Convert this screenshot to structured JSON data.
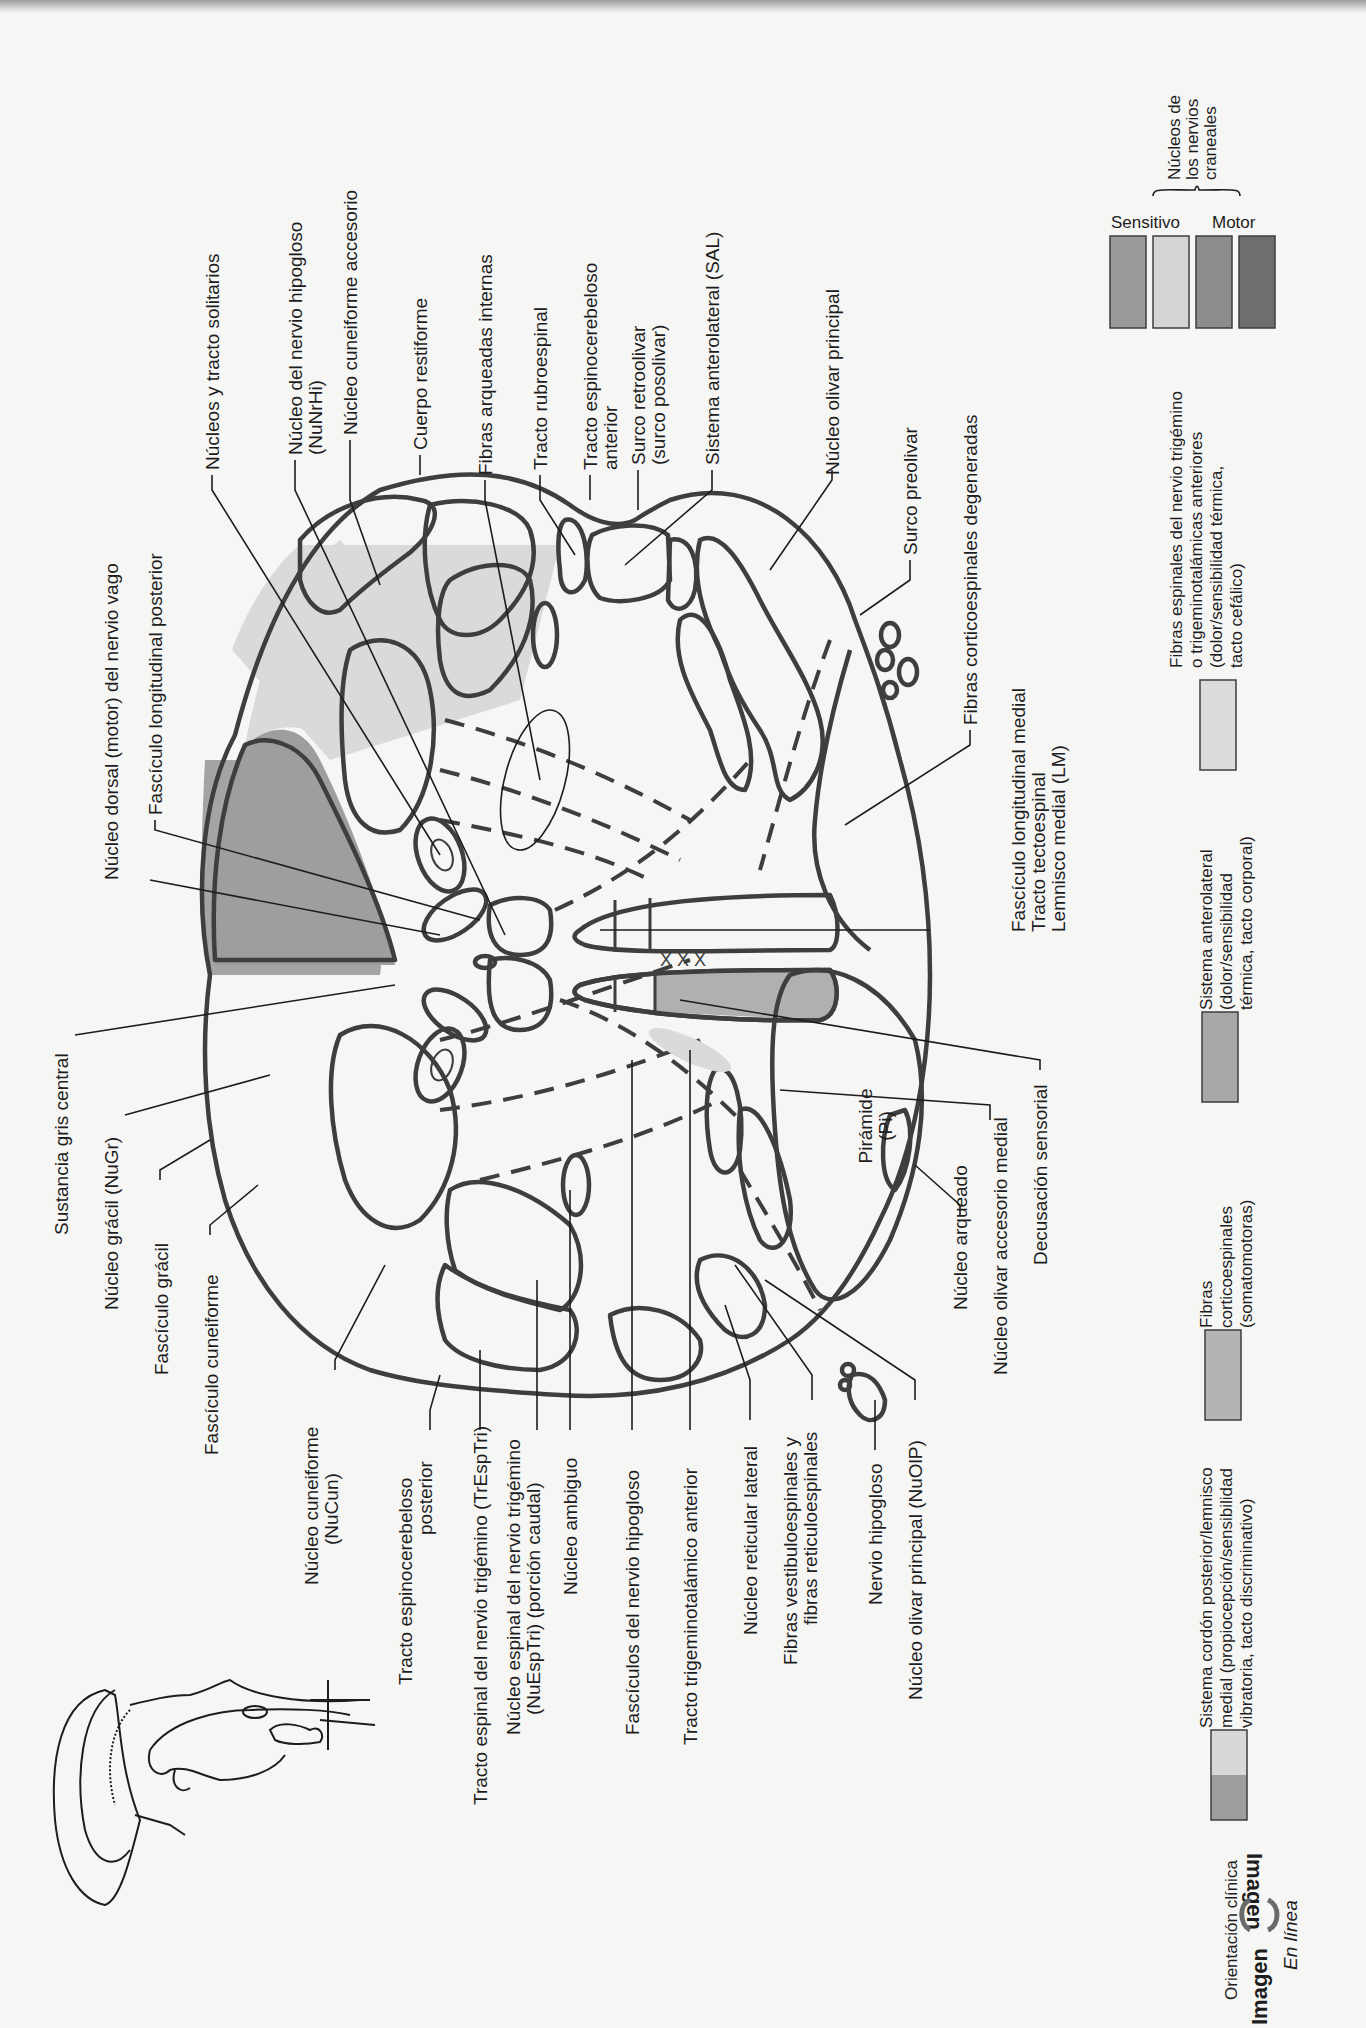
{
  "figure": {
    "orientation": "rotated-90-ccw",
    "cross_section_center_labels": {
      "piramide": "Pirámide",
      "piramide_abbr": "(Pi)"
    }
  },
  "labels_top": [
    {
      "id": "nucleos-tracto-solitarios",
      "lines": [
        "Núcleos y tracto solitarios"
      ]
    },
    {
      "id": "nucleo-nervio-hipogloso",
      "lines": [
        "Núcleo del nervio hipogloso",
        "(NuNrHi)"
      ]
    },
    {
      "id": "nucleo-cuneiforme-accesorio",
      "lines": [
        "Núcleo cuneiforme accesorio"
      ]
    },
    {
      "id": "cuerpo-restiforme",
      "lines": [
        "Cuerpo restiforme"
      ]
    },
    {
      "id": "fibras-arqueadas-internas",
      "lines": [
        "Fibras arqueadas internas"
      ]
    },
    {
      "id": "tracto-rubroespinal",
      "lines": [
        "Tracto rubroespinal"
      ]
    },
    {
      "id": "tracto-espinocerebeloso-anterior",
      "lines": [
        "Tracto espinocerebeloso",
        "anterior"
      ]
    },
    {
      "id": "surco-retroolivar",
      "lines": [
        "Surco retroolivar",
        "(surco posolivar)"
      ]
    },
    {
      "id": "sistema-anterolateral",
      "lines": [
        "Sistema anterolateral (SAL)"
      ]
    },
    {
      "id": "nucleo-olivar-principal-top",
      "lines": [
        "Núcleo olivar principal"
      ]
    },
    {
      "id": "surco-preolivar",
      "lines": [
        "Surco preolivar"
      ]
    },
    {
      "id": "fibras-corticoespinales-degeneradas",
      "lines": [
        "Fibras corticoespinales degeneradas"
      ]
    }
  ],
  "labels_left_upper": [
    {
      "id": "nucleo-dorsal-vago",
      "lines": [
        "Núcleo dorsal (motor) del nervio vago"
      ]
    },
    {
      "id": "fasciculo-longitudinal-posterior",
      "lines": [
        "Fascículo longitudinal posterior"
      ]
    }
  ],
  "labels_right_mid": [
    {
      "id": "flm-tt-lm",
      "lines": [
        "Fascículo longitudinal medial",
        "Tracto tectoespinal",
        "Lemnisco medial (LM)"
      ]
    },
    {
      "id": "decusacion-sensorial",
      "lines": [
        "Decusación sensorial"
      ]
    },
    {
      "id": "nucleo-olivar-accesorio-medial",
      "lines": [
        "Núcleo olivar accesorio medial"
      ]
    },
    {
      "id": "nucleo-arqueado",
      "lines": [
        "Núcleo arqueado"
      ]
    }
  ],
  "labels_left": [
    {
      "id": "sustancia-gris-central",
      "lines": [
        "Sustancia gris central"
      ]
    },
    {
      "id": "nucleo-gracil",
      "lines": [
        "Núcleo grácil (NuGr)"
      ]
    },
    {
      "id": "fasciculo-gracil",
      "lines": [
        "Fascículo grácil"
      ]
    },
    {
      "id": "fasciculo-cuneiforme",
      "lines": [
        "Fascículo cuneiforme"
      ]
    },
    {
      "id": "nucleo-cuneiforme",
      "lines": [
        "Núcleo cuneiforme",
        "(NuCun)"
      ]
    }
  ],
  "labels_bottom": [
    {
      "id": "tracto-espinocerebeloso-posterior",
      "lines": [
        "Tracto espinocerebeloso",
        "posterior"
      ]
    },
    {
      "id": "tracto-espinal-trigemino",
      "lines": [
        "Tracto espinal del nervio trigémino (TrEspTri)"
      ]
    },
    {
      "id": "nucleo-espinal-trigemino",
      "lines": [
        "Núcleo espinal del nervio trigémino",
        "(NuEspTri) (porción caudal)"
      ]
    },
    {
      "id": "nucleo-ambiguo",
      "lines": [
        "Núcleo ambiguo"
      ]
    },
    {
      "id": "fasciculos-nervio-hipogloso",
      "lines": [
        "Fascículos del nervio hipogloso"
      ]
    },
    {
      "id": "tracto-trigeminotalamico-anterior",
      "lines": [
        "Tracto trigeminotalámico anterior"
      ]
    },
    {
      "id": "nucleo-reticular-lateral",
      "lines": [
        "Núcleo reticular lateral"
      ]
    },
    {
      "id": "fibras-vestibuloespinales",
      "lines": [
        "Fibras vestibuloespinales y",
        "fibras reticuloespinales"
      ]
    },
    {
      "id": "nervio-hipogloso",
      "lines": [
        "Nervio hipogloso"
      ]
    },
    {
      "id": "nucleo-olivar-principal",
      "lines": [
        "Núcleo olivar principal (NuOlP)"
      ]
    }
  ],
  "legend": {
    "cranial_nuclei": {
      "title_lines": [
        "Núcleos de",
        "los nervios",
        "craneales"
      ],
      "sensitivo": "Sensitivo",
      "motor": "Motor",
      "swatch_colors": [
        "#9a9a9a",
        "#d4d4d4",
        "#8c8c8c",
        "#6e6e6e"
      ]
    },
    "items": [
      {
        "id": "trigemino",
        "lines": [
          "Fibras espinales del nervio trigémino",
          "o trigeminotalámicas anteriores",
          "(dolor/sensibilidad térmica,",
          "tacto cefálico)"
        ],
        "color": "#dcdcdc"
      },
      {
        "id": "anterolateral",
        "lines": [
          "Sistema anterolateral",
          "(dolor/sensibilidad",
          "térmica, tacto corporal)"
        ],
        "color": "#a8a8a8"
      },
      {
        "id": "corticoespinales",
        "lines": [
          "Fibras",
          "corticoespinales",
          "(somatomotoras)"
        ],
        "color": "#b4b4b4"
      },
      {
        "id": "cordon-posterior",
        "lines": [
          "Sistema cordón posterior/lemnisco",
          "medial (propiocepción/sensibilidad",
          "vibratoria, tacto discriminativo)"
        ],
        "colors": [
          "#9e9e9e",
          "#d8d8d8"
        ]
      }
    ]
  },
  "branding": {
    "orientation": "Orientación clínica",
    "imagen1": "Imagen",
    "imagen2": "Imagen",
    "en_linea": "En línea"
  },
  "colors": {
    "outline": "#3e3e3e",
    "light_gray": "#d9d9d9",
    "mid_gray": "#a9a9a9",
    "dark_gray": "#8a8a8a",
    "darker_gray": "#6f6f6f",
    "background": "#f6f6f5"
  }
}
